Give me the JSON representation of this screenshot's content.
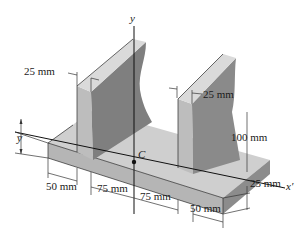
{
  "figure": {
    "axes": {
      "vertical_axis_label": "y",
      "horizontal_axis_label": "x′",
      "centroid_label": "C",
      "centroid_offset_label": "y̅"
    },
    "dimensions": {
      "left_web_thickness": "25 mm",
      "right_web_thickness": "25 mm",
      "web_height": "100 mm",
      "flange_thickness": "25 mm",
      "left_overhang": "50 mm",
      "inner_half_span_left": "75 mm",
      "inner_half_span_right": "75 mm",
      "right_overhang": "50 mm"
    },
    "colors": {
      "background": "#ffffff",
      "top_face": "#d6d6d6",
      "front_face": "#bdbdbd",
      "side_face": "#8f8f8f",
      "dark_side_face": "#7d7d7d",
      "floor_face": "#c9c9c9",
      "line": "#1a1a1a"
    }
  }
}
